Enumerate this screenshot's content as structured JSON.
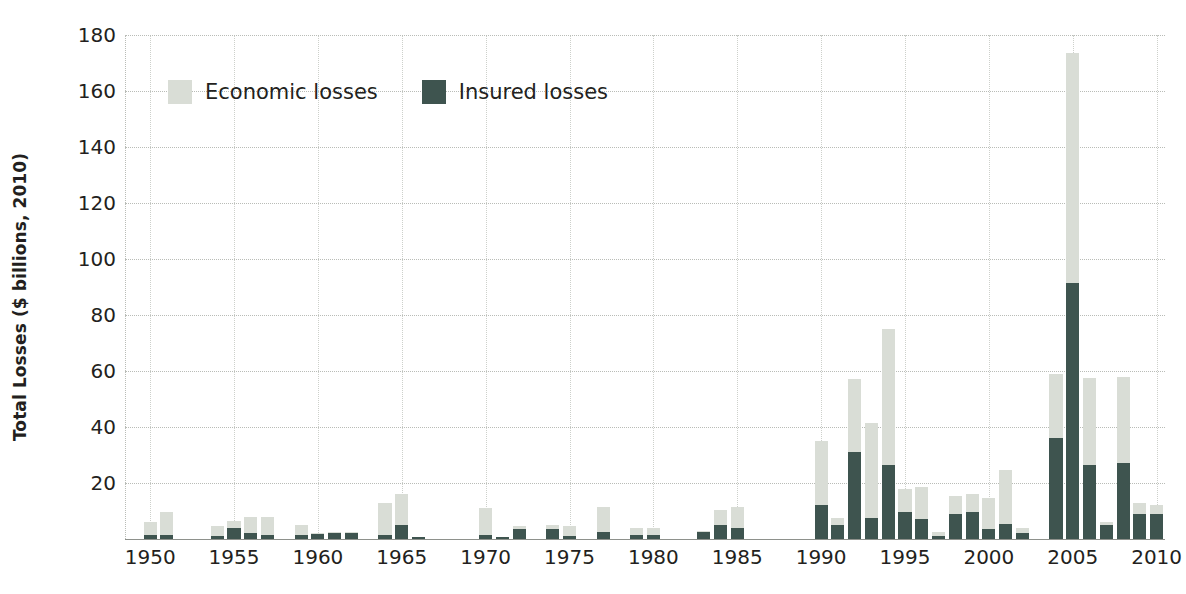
{
  "chart_data": {
    "type": "bar",
    "stacked": true,
    "title": "",
    "xlabel": "",
    "ylabel": "Total Losses ($ billions, 2010)",
    "ylim": [
      0,
      180
    ],
    "xlim": [
      1949,
      2011
    ],
    "ytick_labels": [
      "180",
      "160",
      "140",
      "120",
      "100",
      "80",
      "60",
      "40",
      "20"
    ],
    "ytick_values": [
      180,
      160,
      140,
      120,
      100,
      80,
      60,
      40,
      20
    ],
    "xtick_labels": [
      "1950",
      "1955",
      "1960",
      "1965",
      "1970",
      "1975",
      "1980",
      "1985",
      "1990",
      "1995",
      "2000",
      "2005",
      "2010"
    ],
    "xtick_values": [
      1950,
      1955,
      1960,
      1965,
      1970,
      1975,
      1980,
      1985,
      1990,
      1995,
      2000,
      2005,
      2010
    ],
    "grid": true,
    "legend_position": "upper-left",
    "series": [
      {
        "name": "Economic losses",
        "color": "#d9ddd6",
        "note": "total height of stacked bar"
      },
      {
        "name": "Insured losses",
        "color": "#3e544f",
        "note": "lower dark portion of stacked bar"
      }
    ],
    "categories": [
      1950,
      1951,
      1952,
      1953,
      1954,
      1955,
      1956,
      1957,
      1958,
      1959,
      1960,
      1961,
      1962,
      1963,
      1964,
      1965,
      1966,
      1967,
      1968,
      1969,
      1970,
      1971,
      1972,
      1973,
      1974,
      1975,
      1976,
      1977,
      1978,
      1979,
      1980,
      1981,
      1982,
      1983,
      1984,
      1985,
      1986,
      1987,
      1988,
      1989,
      1990,
      1991,
      1992,
      1993,
      1994,
      1995,
      1996,
      1997,
      1998,
      1999,
      2000,
      2001,
      2002,
      2003,
      2004,
      2005,
      2006,
      2007,
      2008,
      2009,
      2010
    ],
    "total_values": [
      6,
      9.5,
      0,
      0,
      4.5,
      6.5,
      8,
      8,
      0,
      5,
      2,
      2.5,
      2.5,
      0,
      13,
      16,
      0.7,
      0,
      0,
      0,
      11,
      0.5,
      4.5,
      0,
      5,
      4.5,
      0,
      11.5,
      0,
      4,
      4,
      0,
      0,
      3,
      10.5,
      11.5,
      0,
      0,
      0,
      0,
      35,
      7.5,
      57,
      41.5,
      75,
      18,
      18.5,
      2.5,
      15.5,
      16,
      14.5,
      24.5,
      4,
      0,
      59,
      173.5,
      57.5,
      6,
      58,
      13,
      12
    ],
    "insured_values": [
      1.5,
      1.5,
      0,
      0,
      1.2,
      4,
      2,
      1.5,
      0,
      1.5,
      1.8,
      2.2,
      2.2,
      0,
      1.5,
      5,
      0.4,
      0,
      0,
      0,
      1.5,
      0.4,
      3.5,
      0,
      3.5,
      1.2,
      0,
      2.5,
      0,
      1.5,
      1.5,
      0,
      0,
      2.5,
      5,
      4,
      0,
      0,
      0,
      0,
      12,
      5,
      31,
      7.5,
      26.5,
      9.5,
      7,
      1.2,
      9,
      9.5,
      3.5,
      5.5,
      2,
      0,
      36,
      91.5,
      26.5,
      5,
      27,
      9,
      9
    ]
  },
  "legend": {
    "items": [
      {
        "label": "Economic losses",
        "swatch": "econ"
      },
      {
        "label": "Insured losses",
        "swatch": "ins"
      }
    ]
  },
  "axis": {
    "y_title": "Total Losses ($ billions, 2010)"
  }
}
